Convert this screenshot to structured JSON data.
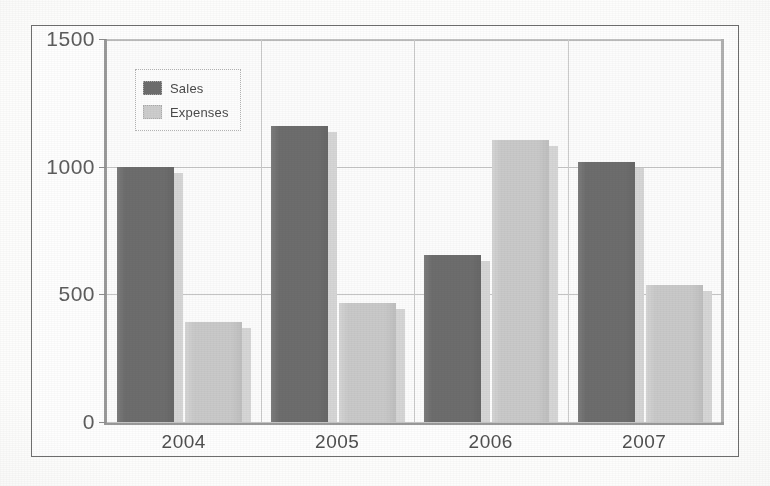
{
  "chart_data": {
    "type": "bar",
    "title": "",
    "subtitle": "",
    "xlabel": "",
    "ylabel": "",
    "categories": [
      "2004",
      "2005",
      "2006",
      "2007"
    ],
    "series": [
      {
        "name": "Sales",
        "color": "#6d6d6d",
        "values": [
          1000,
          1160,
          655,
          1020
        ]
      },
      {
        "name": "Expenses",
        "color": "#c9c9c9",
        "values": [
          390,
          465,
          1105,
          535
        ]
      }
    ],
    "ylim": [
      0,
      1500
    ],
    "yticks": [
      0,
      500,
      1000,
      1500
    ],
    "ytick_labels": [
      "0",
      "500",
      "1000",
      "1500"
    ],
    "grid": true,
    "grid_axis": "both",
    "legend_position": "upper-left",
    "legend_entries": [
      "Sales",
      "Expenses"
    ],
    "annotations": []
  },
  "legend": {
    "items": [
      {
        "label": "Sales",
        "swatch": "sales-color-swatch"
      },
      {
        "label": "Expenses",
        "swatch": "expenses-color-swatch"
      }
    ]
  },
  "axes": {
    "y_labels": [
      "1500",
      "1000",
      "500",
      "0"
    ],
    "x_labels": [
      "2004",
      "2005",
      "2006",
      "2007"
    ]
  },
  "colors": {
    "sales": "#6d6d6d",
    "expenses": "#c9c9c9",
    "gridline": "#c4c4c4",
    "frame": "#6e6e6e",
    "axis": "#9a9a9a",
    "text": "#4f4f4f",
    "page": "#fdfdfc"
  }
}
